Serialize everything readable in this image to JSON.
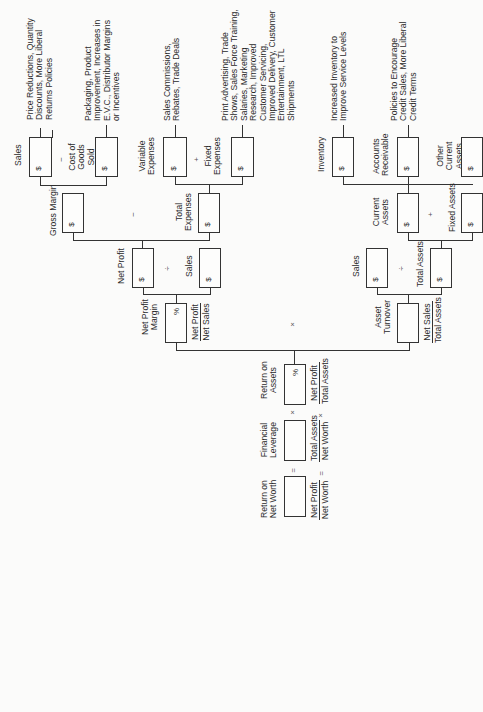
{
  "nodes": {
    "sales1": {
      "label": "Sales",
      "unit": "$"
    },
    "cogs": {
      "label": "Cost of Goods Sold",
      "unit": "$"
    },
    "gross_margin": {
      "label": "Gross Margin",
      "unit": "$"
    },
    "variable_expenses": {
      "label": "Variable Expenses",
      "unit": "$"
    },
    "fixed_expenses": {
      "label": "Fixed Expenses",
      "unit": "$"
    },
    "total_expenses": {
      "label": "Total Expenses",
      "unit": "$"
    },
    "net_profit": {
      "label": "Net Profit",
      "unit": "$"
    },
    "sales2": {
      "label": "Sales",
      "unit": "$"
    },
    "net_profit_margin": {
      "label": "Net Profit Margin",
      "unit": "%",
      "frac_num": "Net Profit",
      "frac_den": "Net Sales"
    },
    "return_on_assets": {
      "label": "Return on Assets",
      "unit": "%",
      "frac_num": "Net Profit",
      "frac_den": "Total Assets"
    },
    "financial_leverage": {
      "label": "Financial Leverage",
      "frac_num": "Total Assets",
      "frac_den": "Net Worth"
    },
    "return_on_net_worth": {
      "label": "Return on Net Worth",
      "frac_num": "Net Profit",
      "frac_den": "Net Worth"
    },
    "inventory": {
      "label": "Inventory",
      "unit": "$"
    },
    "accounts_receivable": {
      "label": "Accounts Receivable",
      "unit": "$"
    },
    "other_current_assets": {
      "label": "Other Current Assets",
      "unit": "$"
    },
    "current_assets": {
      "label": "Current Assets",
      "unit": "$"
    },
    "fixed_assets": {
      "label": "Fixed Assets",
      "unit": "$"
    },
    "sales3": {
      "label": "Sales",
      "unit": "$"
    },
    "total_assets": {
      "label": "Total Assets",
      "unit": "$"
    },
    "asset_turnover": {
      "label": "Asset Turnover",
      "frac_num": "Net Sales",
      "frac_den": "Total Assets"
    }
  },
  "annotations": {
    "sales": "Price Reductions, Quantity Discounts, More Liberal Returns Policies",
    "cogs": "Packaging, Product Improvement, Increases in E.V.C., Distributor Margins or Incentives",
    "variable_expenses": "Sales Commissions, Rebates, Trade Deals",
    "fixed_expenses": "Print Advertising, Trade Shows, Sales Force Training, Salaries, Marketing Research, Improved Customer Servicing, Improved Delivery, Customer Entertainment, LTL Shipments",
    "inventory": "Increased Inventory to Improve Service Levels",
    "accounts_receivable": "Policies to Encourage Credit Sales, More Liberal Credit Terms"
  },
  "operators": {
    "minus": "−",
    "plus": "+",
    "divide": "÷",
    "times": "×",
    "equals": "="
  }
}
